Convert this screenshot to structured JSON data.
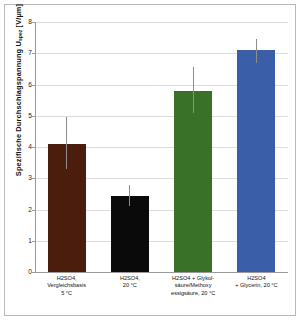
{
  "chart_data": {
    "type": "bar",
    "title": "",
    "xlabel": "",
    "ylabel": "Spezifische Durchschlagspannung  U",
    "ylabel_sub": "spez",
    "ylabel_unit": "  [V/µm]",
    "ylim": [
      0,
      8
    ],
    "ytick_step": 1,
    "grid": true,
    "legend": "none",
    "ytick_labels": [
      "0",
      "1",
      "2",
      "3",
      "4",
      "5",
      "6",
      "7",
      "8"
    ],
    "categories": [
      "H2SO4,\nVergleichsbasis\n5 °C",
      "H2SO4,\n20 °C",
      "H2SO4 + Glykol-\nsäure/Methoxy\nessigsäure, 20 °C",
      "H2SO4\n+ Glycerin, 20 °C"
    ],
    "category_lines": [
      [
        "H2SO4,",
        "Vergleichsbasis",
        "5 °C"
      ],
      [
        "H2SO4,",
        "20 °C"
      ],
      [
        "H2SO4 + Glykol-",
        "säure/Methoxy",
        "essigsäure, 20 °C"
      ],
      [
        "H2SO4",
        "+ Glycerin, 20 °C"
      ]
    ],
    "values": [
      4.1,
      2.42,
      5.8,
      7.1
    ],
    "error_low": [
      3.3,
      2.1,
      5.1,
      6.7
    ],
    "error_high": [
      4.95,
      2.8,
      6.55,
      7.45
    ],
    "bar_colors": [
      "#4a1d0c",
      "#0a0a0a",
      "#3a7129",
      "#3a5fa8"
    ],
    "error_color": "#8e8e8e",
    "grid_color": "#dcdcdc",
    "axis_color": "#9a9a9a",
    "background": "#ffffff"
  }
}
